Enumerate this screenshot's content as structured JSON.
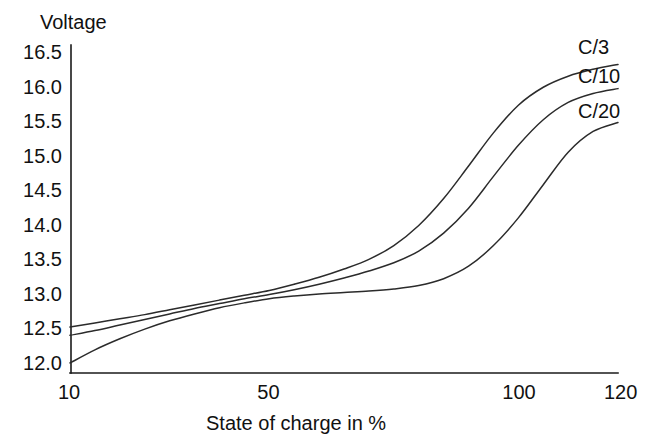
{
  "chart_data": {
    "type": "line",
    "title": "",
    "xlabel": "State of charge in %",
    "ylabel": "Voltage",
    "xlim": [
      10,
      120
    ],
    "ylim": [
      12.0,
      16.5
    ],
    "grid": false,
    "legend_position": "right-inline-end-of-line",
    "xticks": [
      10,
      50,
      100,
      120
    ],
    "xtick_labels": [
      "10",
      "50",
      "100",
      "120"
    ],
    "yticks": [
      12.0,
      12.5,
      13.0,
      13.5,
      14.0,
      14.5,
      15.0,
      15.5,
      16.0,
      16.5
    ],
    "ytick_labels": [
      "12.0",
      "12.5",
      "13.0",
      "13.5",
      "14.0",
      "14.5",
      "15.0",
      "15.5",
      "16.0",
      "16.5"
    ],
    "series": [
      {
        "name": "C/3",
        "label": "C/3",
        "x": [
          10,
          15,
          20,
          25,
          30,
          35,
          40,
          45,
          50,
          55,
          60,
          65,
          70,
          75,
          80,
          85,
          90,
          95,
          100,
          105,
          110,
          115,
          120
        ],
        "values": [
          12.52,
          12.58,
          12.64,
          12.7,
          12.77,
          12.84,
          12.91,
          12.98,
          13.05,
          13.14,
          13.24,
          13.36,
          13.5,
          13.7,
          13.99,
          14.38,
          14.85,
          15.33,
          15.73,
          15.99,
          16.15,
          16.25,
          16.32
        ]
      },
      {
        "name": "C/10",
        "label": "C/10",
        "x": [
          10,
          15,
          20,
          25,
          30,
          35,
          40,
          45,
          50,
          55,
          60,
          65,
          70,
          75,
          80,
          85,
          90,
          95,
          100,
          105,
          110,
          115,
          120
        ],
        "values": [
          12.4,
          12.47,
          12.55,
          12.63,
          12.71,
          12.79,
          12.86,
          12.93,
          12.99,
          13.06,
          13.14,
          13.23,
          13.33,
          13.45,
          13.62,
          13.88,
          14.24,
          14.7,
          15.15,
          15.52,
          15.77,
          15.9,
          15.97
        ]
      },
      {
        "name": "C/20",
        "label": "C/20",
        "x": [
          10,
          15,
          20,
          25,
          30,
          35,
          40,
          45,
          50,
          55,
          60,
          65,
          70,
          75,
          80,
          85,
          90,
          95,
          100,
          105,
          110,
          115,
          120
        ],
        "values": [
          12.0,
          12.19,
          12.35,
          12.49,
          12.61,
          12.71,
          12.8,
          12.87,
          12.93,
          12.97,
          13.0,
          13.02,
          13.04,
          13.07,
          13.12,
          13.22,
          13.4,
          13.7,
          14.1,
          14.58,
          15.05,
          15.35,
          15.48
        ]
      }
    ]
  },
  "axes": {
    "y_title": "Voltage",
    "x_title": "State of charge in %"
  }
}
